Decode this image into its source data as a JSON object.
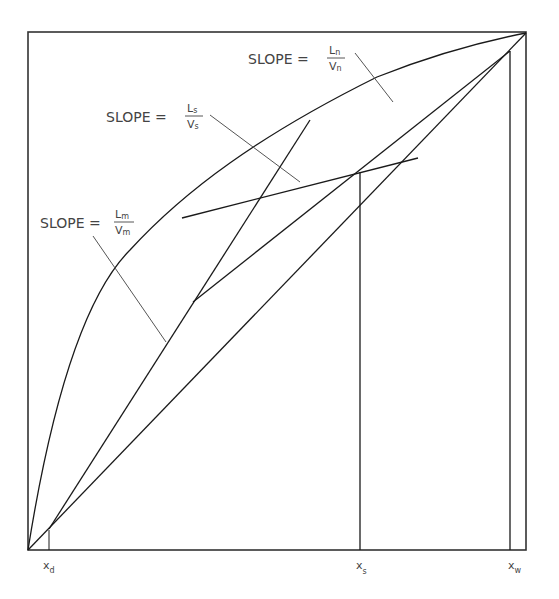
{
  "labels": {
    "slope_n": {
      "prefix": "SLOPE =",
      "num": "L",
      "num_sub": "n",
      "den": "V",
      "den_sub": "n"
    },
    "slope_s": {
      "prefix": "SLOPE =",
      "num": "L",
      "num_sub": "s",
      "den": "V",
      "den_sub": "s"
    },
    "slope_m": {
      "prefix": "SLOPE =",
      "num": "L",
      "num_sub": "m",
      "den": "V",
      "den_sub": "m"
    }
  },
  "axis_ticks": {
    "x_d": {
      "main": "x",
      "sub": "d"
    },
    "x_s": {
      "main": "x",
      "sub": "s"
    },
    "x_w": {
      "main": "x",
      "sub": "w"
    }
  },
  "colors": {
    "line": "#1a1a1a",
    "leader": "#555555",
    "text": "#444444"
  }
}
